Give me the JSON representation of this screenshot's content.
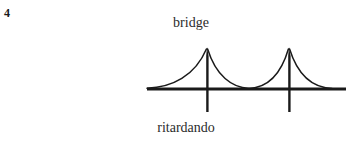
{
  "figure": {
    "number": "4",
    "label_top": "bridge",
    "label_bottom": "ritardando",
    "ink_color": "#1a1a1a",
    "background_color": "#ffffff",
    "width_px": 346,
    "height_px": 141
  },
  "diagram": {
    "name": "suspension-bridge-ritardando",
    "baseline": {
      "x_start": 147,
      "x_end": 346,
      "y": 89,
      "thickness_px": 3
    },
    "towers": [
      {
        "x": 207,
        "apex_y": 48,
        "base_y": 112
      },
      {
        "x": 289,
        "apex_y": 48,
        "base_y": 112
      }
    ],
    "cables": [
      {
        "from_x": 147,
        "from_y": 89,
        "to_x": 207,
        "to_y": 48,
        "side": "left-approach"
      },
      {
        "from_x": 207,
        "from_y": 48,
        "to_x": 249,
        "to_y": 89,
        "side": "span-left-half"
      },
      {
        "from_x": 249,
        "from_y": 89,
        "to_x": 289,
        "to_y": 48,
        "side": "span-right-half"
      },
      {
        "from_x": 289,
        "from_y": 48,
        "to_x": 332,
        "to_y": 89,
        "side": "right-approach"
      }
    ]
  }
}
